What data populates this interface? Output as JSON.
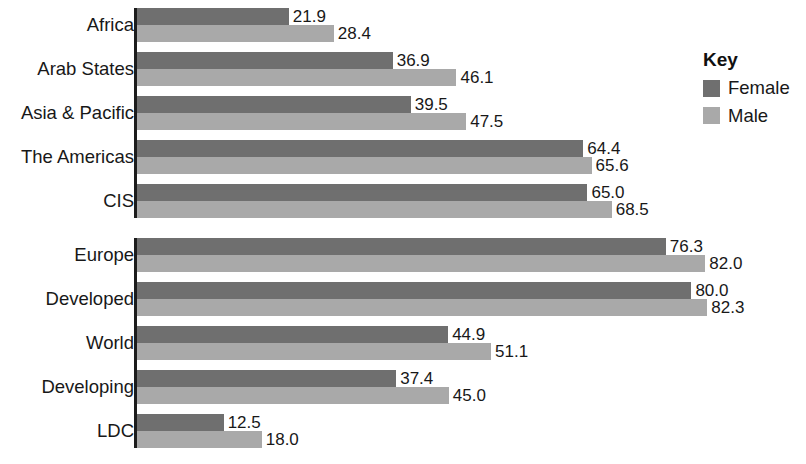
{
  "chart_data": {
    "type": "bar",
    "orientation": "horizontal",
    "title": "",
    "subtitle": "",
    "xlabel": "",
    "ylabel": "",
    "grid": false,
    "axis_ticks_visible": false,
    "xlim": [
      0,
      100
    ],
    "data_labels": true,
    "legend": {
      "title": "Key",
      "position": "right",
      "entries": [
        {
          "name": "Female",
          "color": "#6f6f6f"
        },
        {
          "name": "Male",
          "color": "#a9a9a9"
        }
      ]
    },
    "categories": [
      "Africa",
      "Arab States",
      "Asia & Pacific",
      "The Americas",
      "CIS",
      "Europe",
      "Developed",
      "World",
      "Developing",
      "LDC"
    ],
    "series": [
      {
        "name": "Female",
        "color": "#6f6f6f",
        "values": [
          21.9,
          36.9,
          39.5,
          64.4,
          65.0,
          76.3,
          80.0,
          44.9,
          37.4,
          12.5
        ]
      },
      {
        "name": "Male",
        "color": "#a9a9a9",
        "values": [
          28.4,
          46.1,
          47.5,
          65.6,
          68.5,
          82.0,
          82.3,
          51.1,
          45.0,
          18.0
        ]
      }
    ],
    "group_breaks_after": [
      "CIS"
    ]
  },
  "groups": [
    {
      "label": "Africa",
      "female": {
        "value": 21.9,
        "label": "21.9"
      },
      "male": {
        "value": 28.4,
        "label": "28.4"
      }
    },
    {
      "label": "Arab States",
      "female": {
        "value": 36.9,
        "label": "36.9"
      },
      "male": {
        "value": 46.1,
        "label": "46.1"
      }
    },
    {
      "label": "Asia & Pacific",
      "female": {
        "value": 39.5,
        "label": "39.5"
      },
      "male": {
        "value": 47.5,
        "label": "47.5"
      }
    },
    {
      "label": "The Americas",
      "female": {
        "value": 64.4,
        "label": "64.4"
      },
      "male": {
        "value": 65.6,
        "label": "65.6"
      }
    },
    {
      "label": "CIS",
      "female": {
        "value": 65.0,
        "label": "65.0"
      },
      "male": {
        "value": 68.5,
        "label": "68.5"
      }
    },
    {
      "label": "Europe",
      "female": {
        "value": 76.3,
        "label": "76.3"
      },
      "male": {
        "value": 82.0,
        "label": "82.0"
      }
    },
    {
      "label": "Developed",
      "female": {
        "value": 80.0,
        "label": "80.0"
      },
      "male": {
        "value": 82.3,
        "label": "82.3"
      }
    },
    {
      "label": "World",
      "female": {
        "value": 44.9,
        "label": "44.9"
      },
      "male": {
        "value": 51.1,
        "label": "51.1"
      }
    },
    {
      "label": "Developing",
      "female": {
        "value": 37.4,
        "label": "37.4"
      },
      "male": {
        "value": 45.0,
        "label": "45.0"
      }
    },
    {
      "label": "LDC",
      "female": {
        "value": 12.5,
        "label": "12.5"
      },
      "male": {
        "value": 18.0,
        "label": "18.0"
      }
    }
  ],
  "legend": {
    "title": "Key",
    "items": [
      {
        "label": "Female",
        "swatch": "female"
      },
      {
        "label": "Male",
        "swatch": "male"
      }
    ]
  },
  "layout": {
    "axis_x": 137,
    "px_per_unit": 6.93,
    "group_height": 44,
    "first_group_top": 8,
    "break_after_index": 4,
    "break_gap": 10,
    "bar_height": 17
  },
  "colors": {
    "female": "#6f6f6f",
    "male": "#a9a9a9",
    "axis": "#1c1c1c",
    "text": "#181818",
    "background": "#ffffff"
  }
}
